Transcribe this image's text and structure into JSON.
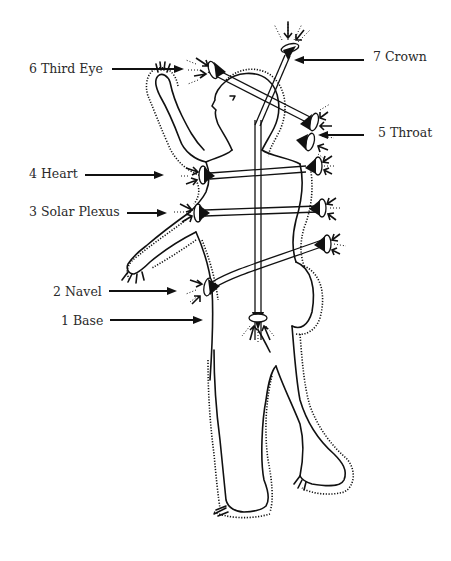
{
  "diagram": {
    "labels": [
      {
        "id": "crown",
        "number": "7",
        "name": "Crown",
        "text": "7 Crown",
        "side": "right"
      },
      {
        "id": "third-eye",
        "number": "6",
        "name": "Third Eye",
        "text": "6 Third Eye",
        "side": "left"
      },
      {
        "id": "throat",
        "number": "5",
        "name": "Throat",
        "text": "5 Throat",
        "side": "right"
      },
      {
        "id": "heart",
        "number": "4",
        "name": "Heart",
        "text": "4 Heart",
        "side": "left"
      },
      {
        "id": "solar-plexus",
        "number": "3",
        "name": "Solar Plexus",
        "text": "3 Solar Plexus",
        "side": "left"
      },
      {
        "id": "navel",
        "number": "2",
        "name": "Navel",
        "text": "2 Navel",
        "side": "left"
      },
      {
        "id": "base",
        "number": "1",
        "name": "Base",
        "text": "1 Base",
        "side": "left"
      }
    ],
    "colors": {
      "ink": "#111111",
      "text": "#2a2a2a",
      "background": "#ffffff"
    }
  }
}
